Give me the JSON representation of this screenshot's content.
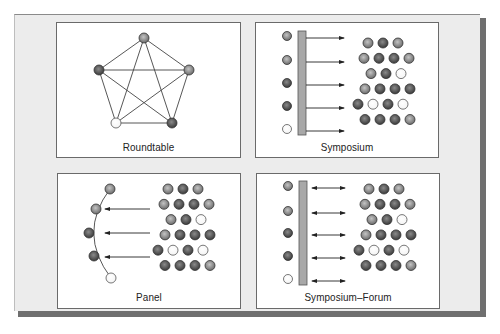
{
  "colors": {
    "frame_bg": "#ececec",
    "shadow": "#6f6f6f",
    "panel_border": "#6a6a6a",
    "line": "#444444",
    "bar_fill": "#a8a8a8",
    "dot_dark": "#4a4a4a",
    "dot_mid": "#8c8c8c",
    "dot_light": "#ffffff"
  },
  "panels": [
    {
      "id": "roundtable",
      "label": "Roundtable",
      "nodes": [
        {
          "x": 87,
          "y": 15,
          "tone": "mid"
        },
        {
          "x": 42,
          "y": 47,
          "tone": "dark"
        },
        {
          "x": 132,
          "y": 47,
          "tone": "mid"
        },
        {
          "x": 59,
          "y": 100,
          "tone": "light"
        },
        {
          "x": 115,
          "y": 100,
          "tone": "dark"
        }
      ]
    },
    {
      "id": "symposium",
      "label": "Symposium",
      "speakers": [
        "mid",
        "mid",
        "dark",
        "dark",
        "light"
      ],
      "arrow_type": "right"
    },
    {
      "id": "panel",
      "label": "Panel",
      "arc_nodes": [
        {
          "x": 52,
          "y": 15,
          "tone": "mid"
        },
        {
          "x": 38,
          "y": 35,
          "tone": "mid"
        },
        {
          "x": 31,
          "y": 59,
          "tone": "dark"
        },
        {
          "x": 36,
          "y": 82,
          "tone": "dark"
        },
        {
          "x": 53,
          "y": 104,
          "tone": "light"
        }
      ],
      "arrow_type": "left"
    },
    {
      "id": "symposium-forum",
      "label": "Symposium–Forum",
      "speakers": [
        "mid",
        "mid",
        "dark",
        "dark",
        "light"
      ],
      "arrow_type": "both"
    }
  ],
  "audience": [
    {
      "offset": 10,
      "tones": [
        "mid",
        "dark",
        "mid"
      ]
    },
    {
      "offset": 6,
      "tones": [
        "mid",
        "dark",
        "dark",
        "mid"
      ]
    },
    {
      "offset": 13,
      "tones": [
        "mid",
        "dark",
        "light"
      ]
    },
    {
      "offset": 7,
      "tones": [
        "mid",
        "dark",
        "dark",
        "dark"
      ]
    },
    {
      "offset": 0,
      "tones": [
        "dark",
        "light",
        "dark",
        "light"
      ]
    },
    {
      "offset": 7,
      "tones": [
        "dark",
        "dark",
        "dark",
        "mid"
      ]
    }
  ]
}
